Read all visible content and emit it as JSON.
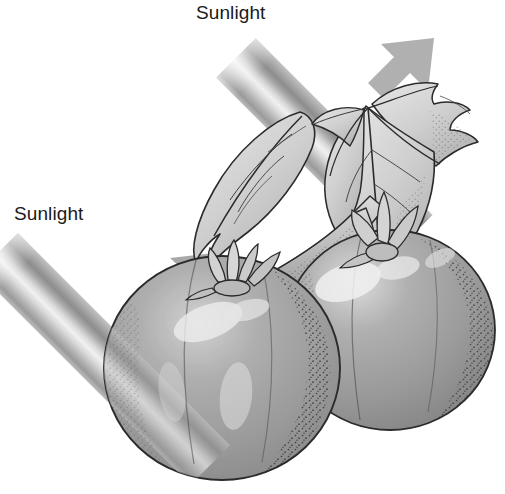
{
  "figure": {
    "kind": "botanical-illustration",
    "background_color": "#ffffff",
    "ink_color": "#1a1a1a"
  },
  "labels": {
    "top": {
      "text": "Sunlight",
      "x": 196,
      "y": 2,
      "color": "#1a1a1a",
      "font_size": 19
    },
    "left": {
      "text": "Sunlight",
      "x": 14,
      "y": 203,
      "color": "#1a1a1a",
      "font_size": 19
    }
  },
  "sunbeams": [
    {
      "name": "upper-right-beam",
      "label": "Sunlight",
      "direction": "points up and to the right",
      "angle_degrees": -45,
      "arrowhead_tip": {
        "x": 432,
        "y": 42
      },
      "origin": {
        "x": 208,
        "y": 30
      },
      "band_colors": [
        "#b9b9b9",
        "#9c9c9c",
        "#8e8e8e",
        "#c8c8c8",
        "#ededed",
        "#d2d2d2",
        "#a8a8a8"
      ]
    },
    {
      "name": "lower-left-beam",
      "label": "Sunlight",
      "direction": "points up and to the right",
      "angle_degrees": -45,
      "arrowhead_tip": {
        "x": 212,
        "y": 252
      },
      "origin": {
        "x": 18,
        "y": 233
      },
      "band_colors": [
        "#b9b9b9",
        "#9c9c9c",
        "#8e8e8e",
        "#c8c8c8",
        "#ededed",
        "#d2d2d2",
        "#a8a8a8"
      ]
    }
  ],
  "plant": {
    "fruits": [
      {
        "name": "front-tomato",
        "position": "lower left, in front",
        "center": {
          "x": 222,
          "y": 368
        },
        "radius_x": 118,
        "radius_y": 112,
        "fill": "#9a9a9a",
        "outline": "#2b2b2b",
        "highlight": "#d9d9d9",
        "stipple": true
      },
      {
        "name": "back-tomato",
        "position": "upper right, behind",
        "center": {
          "x": 390,
          "y": 330
        },
        "radius_x": 105,
        "radius_y": 100,
        "fill": "#9a9a9a",
        "outline": "#2b2b2b",
        "highlight": "#e2e2e2",
        "stipple": true
      }
    ],
    "calyxes": [
      {
        "name": "front-tomato-calyx",
        "sepal_count": 5,
        "fill": "#cfcfcf"
      },
      {
        "name": "back-tomato-calyx",
        "sepal_count": 4,
        "fill": "#cfcfcf"
      }
    ],
    "stem": {
      "name": "main-stem",
      "fill": "#c4c4c4",
      "outline": "#2b2b2b",
      "stipple": true
    },
    "leaves": [
      {
        "name": "left-leaf",
        "lobes": 3,
        "fill": "#d8d8d8",
        "outline": "#2b2b2b"
      },
      {
        "name": "right-leaf-cluster",
        "lobes": 5,
        "fill": "#d4d4d4",
        "outline": "#2b2b2b"
      }
    ]
  }
}
